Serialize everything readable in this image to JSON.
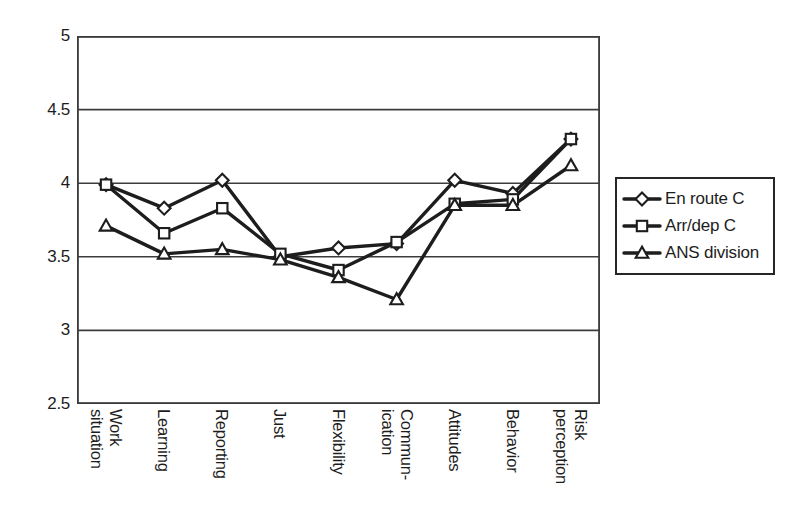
{
  "chart_data": {
    "type": "line",
    "title": "",
    "subtitle": "",
    "xlabel": "",
    "ylabel": "",
    "ylim": [
      2.5,
      5
    ],
    "ytick_labels": [
      "5",
      "4.5",
      "4",
      "3.5",
      "3",
      "2.5"
    ],
    "ytick_values": [
      5,
      4.5,
      4,
      3.5,
      3,
      2.5
    ],
    "grid": "horizontal",
    "legend_position": "right",
    "categories": [
      "Work situation",
      "Learning",
      "Reporting",
      "Just",
      "Flexibility",
      "Commun-ication",
      "Attitudes",
      "Behavior",
      "Risk perception"
    ],
    "category_lines": [
      [
        "Work",
        "situation"
      ],
      [
        "Learning",
        ""
      ],
      [
        "Reporting",
        ""
      ],
      [
        "Just",
        ""
      ],
      [
        "Flexibility",
        ""
      ],
      [
        "Commun-",
        "ication"
      ],
      [
        "Attitudes",
        ""
      ],
      [
        "Behavior",
        ""
      ],
      [
        "Risk",
        "perception"
      ]
    ],
    "series": [
      {
        "name": "En route C",
        "marker": "diamond",
        "values": [
          3.99,
          3.83,
          4.02,
          3.5,
          3.56,
          3.59,
          4.02,
          3.93,
          4.3
        ]
      },
      {
        "name": "Arr/dep C",
        "marker": "square",
        "values": [
          3.99,
          3.66,
          3.83,
          3.52,
          3.41,
          3.6,
          3.86,
          3.89,
          4.3
        ]
      },
      {
        "name": "ANS division",
        "marker": "triangle",
        "values": [
          3.71,
          3.52,
          3.55,
          3.48,
          3.36,
          3.21,
          3.85,
          3.85,
          4.12
        ]
      }
    ],
    "colors": {
      "line": "#1d1d1d",
      "marker_fill": "#ffffff",
      "axis": "#3c3c3c",
      "grid": "#3c3c3c",
      "background": "#ffffff"
    }
  },
  "legend": {
    "items": [
      {
        "label": "En route C",
        "marker": "diamond"
      },
      {
        "label": "Arr/dep C",
        "marker": "square"
      },
      {
        "label": "ANS division",
        "marker": "triangle"
      }
    ]
  }
}
